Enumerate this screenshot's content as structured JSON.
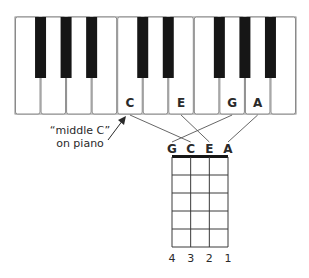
{
  "piano": {
    "white_key_count": 11,
    "labeled_keys": [
      {
        "index": 4,
        "label": "C"
      },
      {
        "index": 6,
        "label": "E"
      },
      {
        "index": 8,
        "label": "G"
      },
      {
        "index": 9,
        "label": "A"
      }
    ],
    "black_key_after_white": [
      0,
      1,
      2,
      4,
      5,
      7,
      8,
      9
    ]
  },
  "annotation": {
    "line1": "“middle C”",
    "line2": "on piano"
  },
  "ukulele": {
    "strings": [
      "G",
      "C",
      "E",
      "A"
    ],
    "string_numbers": [
      "4",
      "3",
      "2",
      "1"
    ],
    "frets": 5
  },
  "mappings": [
    {
      "from": "C",
      "to": "C"
    },
    {
      "from": "E",
      "to": "E"
    },
    {
      "from": "G",
      "to": "G"
    },
    {
      "from": "A",
      "to": "A"
    }
  ],
  "colors": {
    "key_outline": "#8a8a8a",
    "black_key": "#161616",
    "line": "#555555",
    "text": "#2a2a2a"
  }
}
